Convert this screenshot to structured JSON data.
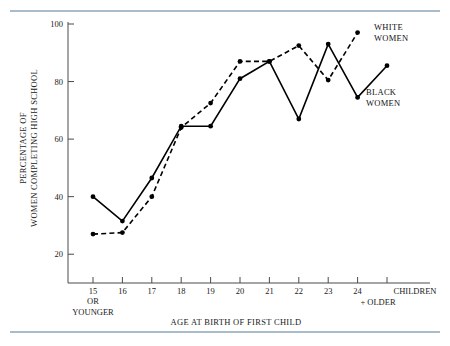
{
  "figure": {
    "ylabel_line1": "PERCENTAGE OF",
    "ylabel_line2": "WOMEN COMPLETING HIGH SCHOOL",
    "xlabel": "AGE AT BIRTH OF FIRST CHILD",
    "xaxis_end_label": "CHILDREN",
    "xaxis_end_sublabel": "+ OLDER",
    "x15_sub1": "OR",
    "x15_sub2": "YOUNGER",
    "legend": {
      "white_line1": "WHITE",
      "white_line2": "WOMEN",
      "black_line1": "BLACK",
      "black_line2": "WOMEN"
    },
    "rule_color": "#a8bccb",
    "line_color": "#000000"
  },
  "chart_data": {
    "type": "line",
    "title": "",
    "xlabel": "AGE AT BIRTH OF FIRST CHILD",
    "ylabel": "PERCENTAGE OF WOMEN COMPLETING HIGH SCHOOL",
    "categories": [
      "15",
      "16",
      "17",
      "18",
      "19",
      "20",
      "21",
      "22",
      "23",
      "24",
      "CHILDREN"
    ],
    "xtick_labels": [
      "15",
      "16",
      "17",
      "18",
      "19",
      "20",
      "21",
      "22",
      "23",
      "24"
    ],
    "ytick_labels": [
      "20",
      "40",
      "60",
      "80",
      "100"
    ],
    "ylim": [
      10,
      100
    ],
    "yticks": [
      20,
      40,
      60,
      80,
      100
    ],
    "grid": false,
    "legend_position": "right-inline",
    "series": [
      {
        "name": "BLACK WOMEN",
        "style": "solid",
        "x": [
          "15",
          "16",
          "17",
          "18",
          "19",
          "20",
          "21",
          "22",
          "23",
          "24",
          "CHILDREN"
        ],
        "values": [
          40,
          31.5,
          46.5,
          64.5,
          64.5,
          81,
          87,
          67,
          93,
          74.5,
          85.5
        ]
      },
      {
        "name": "WHITE WOMEN",
        "style": "dashed",
        "x": [
          "15",
          "16",
          "17",
          "18",
          "19",
          "20",
          "21",
          "22",
          "23",
          "24"
        ],
        "values": [
          27,
          27.5,
          40,
          64,
          72.5,
          87,
          87,
          92.5,
          80.5,
          97
        ]
      }
    ]
  }
}
